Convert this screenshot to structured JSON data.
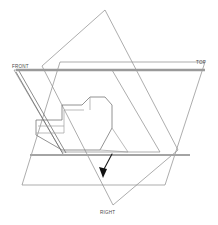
{
  "drawing": {
    "title": "Orthographic Projection Planes",
    "background_color": "#ffffff",
    "line_color": "#8a8a8a",
    "accent_color": "#111111",
    "width": 218,
    "height": 225
  },
  "labels": {
    "front": "FRONT",
    "top": "TOP",
    "right": "RIGHT"
  },
  "planes": [
    {
      "name": "front-plane",
      "label": "FRONT",
      "label_x": 12,
      "label_y": 68,
      "points": "14,70 62,152 160,152 112,70",
      "note": "front projection plane, parallelogram leaning right"
    },
    {
      "name": "top-plane",
      "label": "TOP",
      "label_x": 196,
      "label_y": 64,
      "points": "60,62 205,62 165,185 22,185",
      "note": "top projection plane, trapezoid receding"
    },
    {
      "name": "right-plane",
      "label": "RIGHT",
      "label_x": 103,
      "label_y": 213,
      "points": "105,10 178,150 113,205 42,66",
      "note": "right projection plane, tall parallelogram"
    }
  ],
  "axes": [
    {
      "name": "horizontal-axis-upper",
      "x1": 16,
      "y1": 70,
      "x2": 205,
      "y2": 70
    },
    {
      "name": "horizontal-axis-lower",
      "x1": 30,
      "y1": 155,
      "x2": 190,
      "y2": 155
    }
  ],
  "solid": {
    "name": "notched-block",
    "description": "L-shaped notched block in isometric view",
    "outline": "36,120 62,120 62,105 82,105 90,97 105,97 112,105 112,128 100,150 62,150 36,135",
    "vertex_count": 13
  },
  "annotation": {
    "name": "leader-arrow",
    "tip_x": 101,
    "tip_y": 175,
    "tail_x": 112,
    "tail_y": 154,
    "color": "#111111"
  }
}
